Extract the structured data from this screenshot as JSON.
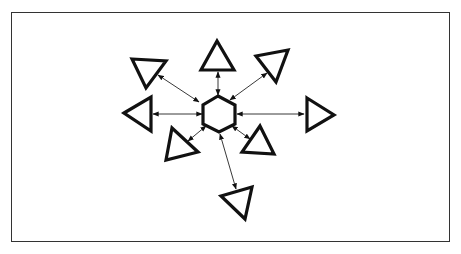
{
  "diagram": {
    "type": "hub-and-spoke",
    "colors": {
      "stroke": "#111111",
      "fill": "#ffffff",
      "frame": "#333333"
    },
    "hub": {
      "shape": "hexagon",
      "points": [
        [
          218,
          96
        ],
        [
          235,
          105
        ],
        [
          235,
          124
        ],
        [
          219,
          132
        ],
        [
          203,
          124
        ],
        [
          203,
          105
        ]
      ]
    },
    "nodes": [
      {
        "id": "top",
        "points": [
          [
            217,
            41
          ],
          [
            201,
            70
          ],
          [
            234,
            70
          ]
        ],
        "link": [
          [
            218,
            72
          ],
          [
            218,
            95
          ]
        ]
      },
      {
        "id": "upper-left",
        "points": [
          [
            132,
            59
          ],
          [
            166,
            61
          ],
          [
            146,
            88
          ]
        ],
        "link": [
          [
            158,
            75
          ],
          [
            199,
            102
          ]
        ]
      },
      {
        "id": "upper-right",
        "points": [
          [
            256,
            56
          ],
          [
            288,
            50
          ],
          [
            276,
            82
          ]
        ],
        "link": [
          [
            267,
            73
          ],
          [
            230,
            100
          ]
        ]
      },
      {
        "id": "left",
        "points": [
          [
            124,
            113
          ],
          [
            151,
            97
          ],
          [
            151,
            131
          ]
        ],
        "link": [
          [
            153,
            114
          ],
          [
            202,
            114
          ]
        ]
      },
      {
        "id": "right",
        "points": [
          [
            307,
            98
          ],
          [
            334,
            115
          ],
          [
            307,
            131
          ]
        ],
        "link": [
          [
            237,
            114
          ],
          [
            304,
            114
          ]
        ]
      },
      {
        "id": "lower-left",
        "points": [
          [
            172,
            128
          ],
          [
            198,
            152
          ],
          [
            166,
            160
          ]
        ],
        "link": [
          [
            188,
            141
          ],
          [
            206,
            126
          ]
        ]
      },
      {
        "id": "lower-right",
        "points": [
          [
            260,
            126
          ],
          [
            274,
            154
          ],
          [
            242,
            152
          ]
        ],
        "link": [
          [
            250,
            139
          ],
          [
            232,
            126
          ]
        ]
      },
      {
        "id": "bottom",
        "points": [
          [
            221,
            196
          ],
          [
            252,
            187
          ],
          [
            245,
            219
          ]
        ],
        "link": [
          [
            220,
            134
          ],
          [
            236,
            189
          ]
        ]
      }
    ]
  }
}
